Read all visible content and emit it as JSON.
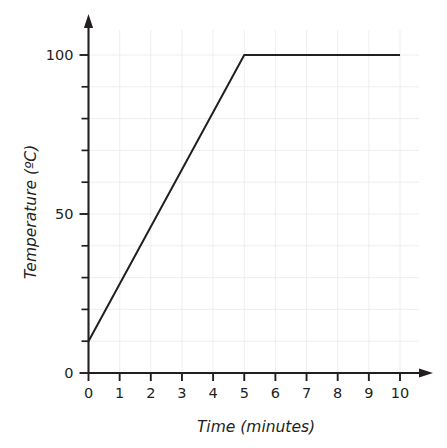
{
  "chart_data": {
    "type": "line",
    "title": "",
    "xlabel": "Time (minutes)",
    "ylabel": "Temperature (ºC)",
    "xlim": [
      0,
      10
    ],
    "ylim": [
      0,
      100
    ],
    "grid": true,
    "legend": "none",
    "x_ticks": [
      {
        "value": 0,
        "label": "0"
      },
      {
        "value": 1,
        "label": "1"
      },
      {
        "value": 2,
        "label": "2"
      },
      {
        "value": 3,
        "label": "3"
      },
      {
        "value": 4,
        "label": "4"
      },
      {
        "value": 5,
        "label": "5"
      },
      {
        "value": 6,
        "label": "6"
      },
      {
        "value": 7,
        "label": "7"
      },
      {
        "value": 8,
        "label": "8"
      },
      {
        "value": 9,
        "label": "9"
      },
      {
        "value": 10,
        "label": "10"
      }
    ],
    "y_ticks": [
      {
        "value": 0,
        "label": "0",
        "major": true
      },
      {
        "value": 10,
        "label": "",
        "major": false
      },
      {
        "value": 20,
        "label": "",
        "major": false
      },
      {
        "value": 30,
        "label": "",
        "major": false
      },
      {
        "value": 40,
        "label": "",
        "major": false
      },
      {
        "value": 50,
        "label": "50",
        "major": true
      },
      {
        "value": 60,
        "label": "",
        "major": false
      },
      {
        "value": 70,
        "label": "",
        "major": false
      },
      {
        "value": 80,
        "label": "",
        "major": false
      },
      {
        "value": 90,
        "label": "",
        "major": false
      },
      {
        "value": 100,
        "label": "100",
        "major": true
      }
    ],
    "series": [
      {
        "name": "Temperature",
        "color": "#231f20",
        "points": [
          {
            "x": 0,
            "y": 10
          },
          {
            "x": 5,
            "y": 100
          },
          {
            "x": 10,
            "y": 100
          }
        ]
      }
    ],
    "annotations": []
  },
  "colors": {
    "axis": "#231f20",
    "grid": "#ececf0",
    "line": "#231f20",
    "background": "#ffffff"
  }
}
